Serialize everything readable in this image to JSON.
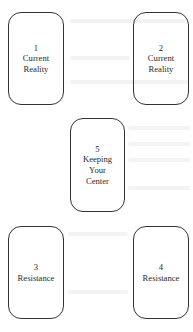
{
  "diagram": {
    "background_color": "#ffffff",
    "card_border_color": "#333333",
    "cards": [
      {
        "number": "1",
        "label_lines": [
          "Current",
          "Reality"
        ],
        "position": "top-left"
      },
      {
        "number": "2",
        "label_lines": [
          "Current",
          "Reality"
        ],
        "position": "top-right"
      },
      {
        "number": "5",
        "label_lines": [
          "Keeping",
          "Your",
          "Center"
        ],
        "position": "center"
      },
      {
        "number": "3",
        "label_lines": [
          "Resistance"
        ],
        "position": "bottom-left"
      },
      {
        "number": "4",
        "label_lines": [
          "Resistance"
        ],
        "position": "bottom-right"
      }
    ]
  }
}
